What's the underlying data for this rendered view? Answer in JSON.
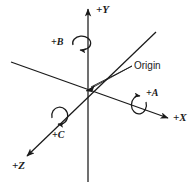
{
  "diagram": {
    "background_color": "#ffffff",
    "line_color": "#1a1a1a",
    "axes": [
      {
        "key": "y",
        "label": "+Y",
        "name": "y-axis",
        "direction": "up"
      },
      {
        "key": "x",
        "label": "+X",
        "name": "x-axis",
        "direction": "down-right"
      },
      {
        "key": "z",
        "label": "+Z",
        "name": "z-axis",
        "direction": "down-left"
      }
    ],
    "rotations": [
      {
        "key": "a",
        "label": "+A",
        "name": "rotation-about-x-axis",
        "about": "+X"
      },
      {
        "key": "b",
        "label": "+B",
        "name": "rotation-about-y-axis",
        "about": "+Y"
      },
      {
        "key": "c",
        "label": "+C",
        "name": "rotation-about-z-axis",
        "about": "+Z"
      }
    ],
    "callout": {
      "label": "Origin",
      "name": "origin-callout",
      "point": {
        "x": 88,
        "y": 88
      }
    }
  }
}
